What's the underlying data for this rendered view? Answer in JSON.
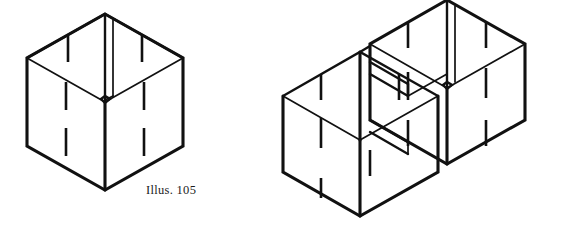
{
  "page": {
    "background_color": "#ffffff",
    "ink_color": "#111111",
    "width": 570,
    "height": 243
  },
  "figures": [
    {
      "id": "illus-105",
      "caption": "Illus. 105",
      "subject": "single open cubical box with slotted interlocking panels",
      "projection": "isometric",
      "parts": {
        "outer_box": "one open-top cube drawn in isometric view",
        "divider_panel": "single vertical panel running front-to-back through the centre of the box",
        "slots": "short vertical kerf marks cut into each panel edge for interlocking"
      },
      "slot_count": 10
    },
    {
      "id": "illus-106",
      "caption": "Illus. 106",
      "subject": "two open cubical boxes joined side by side with slotted interlocking panels",
      "projection": "isometric",
      "parts": {
        "outer_boxes": "two open-top cubes sharing a common middle wall",
        "divider_panel": "vertical panel dividing the right-hand cube",
        "shelf_panel": "horizontal panel set into the upper part of the right-hand cube",
        "slots": "short vertical kerf marks cut into each panel edge for interlocking"
      },
      "slot_count": 14
    }
  ],
  "captions": {
    "left": "Illus. 105",
    "right": "Illus. 106"
  }
}
